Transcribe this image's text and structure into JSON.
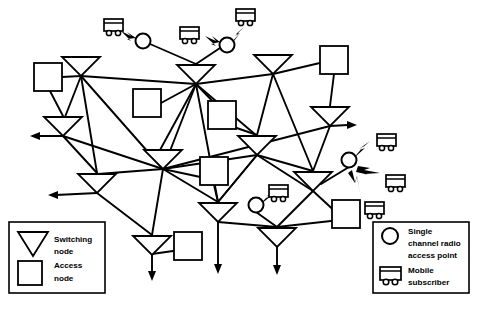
{
  "figure": {
    "kind": "network-topology-diagram"
  },
  "legend_left": {
    "name": "node-type-legend",
    "items": [
      {
        "icon": "switching-node-triangle-icon",
        "line1": "Switching",
        "line2": "node"
      },
      {
        "icon": "access-node-square-icon",
        "line1": "Access",
        "line2": "node"
      }
    ]
  },
  "legend_right": {
    "name": "radio-legend",
    "items": [
      {
        "icon": "radio-access-point-circle-icon",
        "line1": "Single",
        "line2": "channel radio",
        "line3": "access point"
      },
      {
        "icon": "mobile-subscriber-icon",
        "line1": "Mobile",
        "line2": "subscriber",
        "line3": ""
      }
    ]
  },
  "colors": {
    "ink": "#000000",
    "paper": "#ffffff"
  },
  "topology": {
    "switching_nodes": [
      {
        "id": "sn1",
        "label": "switching-node-1",
        "x": 81,
        "y": 57
      },
      {
        "id": "sn2",
        "label": "switching-node-2",
        "x": 196,
        "y": 65
      },
      {
        "id": "sn3",
        "label": "switching-node-3",
        "x": 273,
        "y": 55
      },
      {
        "id": "sn4",
        "label": "switching-node-4",
        "x": 330,
        "y": 107
      },
      {
        "id": "sn5",
        "label": "switching-node-5",
        "x": 63,
        "y": 117
      },
      {
        "id": "sn6",
        "label": "switching-node-6",
        "x": 257,
        "y": 136
      },
      {
        "id": "sn7",
        "label": "switching-node-7",
        "x": 163,
        "y": 150
      },
      {
        "id": "sn8",
        "label": "switching-node-8",
        "x": 97,
        "y": 174
      },
      {
        "id": "sn9",
        "label": "switching-node-9",
        "x": 313,
        "y": 172
      },
      {
        "id": "sn10",
        "label": "switching-node-10",
        "x": 218,
        "y": 203
      },
      {
        "id": "sn11",
        "label": "switching-node-11",
        "x": 152,
        "y": 236
      },
      {
        "id": "sn12",
        "label": "switching-node-12",
        "x": 277,
        "y": 228
      }
    ],
    "access_nodes": [
      {
        "id": "an1",
        "label": "access-node-1",
        "x": 48,
        "y": 77
      },
      {
        "id": "an2",
        "label": "access-node-2",
        "x": 147,
        "y": 99
      },
      {
        "id": "an3",
        "label": "access-node-3",
        "x": 222,
        "y": 111
      },
      {
        "id": "an4",
        "label": "access-node-4",
        "x": 334,
        "y": 60
      },
      {
        "id": "an5",
        "label": "access-node-5",
        "x": 214,
        "y": 171
      },
      {
        "id": "an6",
        "label": "access-node-6",
        "x": 188,
        "y": 245
      },
      {
        "id": "an7",
        "label": "access-node-7",
        "x": 346,
        "y": 214
      }
    ],
    "radio_access_points": [
      {
        "id": "rap1",
        "label": "radio-access-point-1",
        "x": 143,
        "y": 41
      },
      {
        "id": "rap2",
        "label": "radio-access-point-2",
        "x": 227,
        "y": 45
      },
      {
        "id": "rap3",
        "label": "radio-access-point-3",
        "x": 349,
        "y": 160
      },
      {
        "id": "rap4",
        "label": "radio-access-point-4",
        "x": 256,
        "y": 205
      }
    ],
    "mobile_subscribers": [
      {
        "id": "ms1",
        "label": "mobile-subscriber-1",
        "x": 113,
        "y": 27
      },
      {
        "id": "ms2",
        "label": "mobile-subscriber-2",
        "x": 189,
        "y": 35
      },
      {
        "id": "ms3",
        "label": "mobile-subscriber-3",
        "x": 245,
        "y": 17
      },
      {
        "id": "ms4",
        "label": "mobile-subscriber-4",
        "x": 386,
        "y": 142
      },
      {
        "id": "ms5",
        "label": "mobile-subscriber-5",
        "x": 395,
        "y": 183
      },
      {
        "id": "ms6",
        "label": "mobile-subscriber-6",
        "x": 374,
        "y": 210
      },
      {
        "id": "ms7",
        "label": "mobile-subscriber-7",
        "x": 278,
        "y": 193
      }
    ],
    "external_arrows": [
      {
        "label": "trunk-arrow-left-upper",
        "from": "sn5",
        "dir": "left"
      },
      {
        "label": "trunk-arrow-left-lower",
        "from": "sn8",
        "dir": "left"
      },
      {
        "label": "trunk-arrow-right",
        "from": "sn4",
        "dir": "right"
      },
      {
        "label": "trunk-arrow-down-left",
        "from": "sn11",
        "dir": "down"
      },
      {
        "label": "trunk-arrow-down-mid",
        "from": "sn10",
        "dir": "down"
      },
      {
        "label": "trunk-arrow-down-right",
        "from": "sn12",
        "dir": "down"
      }
    ]
  }
}
